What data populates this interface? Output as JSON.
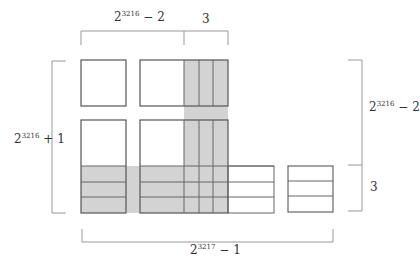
{
  "labels": {
    "top_left": {
      "base": "2",
      "exp": "3216",
      "rest": " − 2"
    },
    "top_right": {
      "text": "3"
    },
    "left": {
      "base": "2",
      "exp": "3216",
      "rest": " + 1"
    },
    "right_top": {
      "base": "2",
      "exp": "3216",
      "rest": " − 2"
    },
    "right_bottom": {
      "text": "3"
    },
    "bottom": {
      "base": "2",
      "exp": "3217",
      "rest": " − 1"
    }
  },
  "colors": {
    "shade": "#d3d3d3",
    "line": "#555555",
    "bracket": "#999999"
  }
}
